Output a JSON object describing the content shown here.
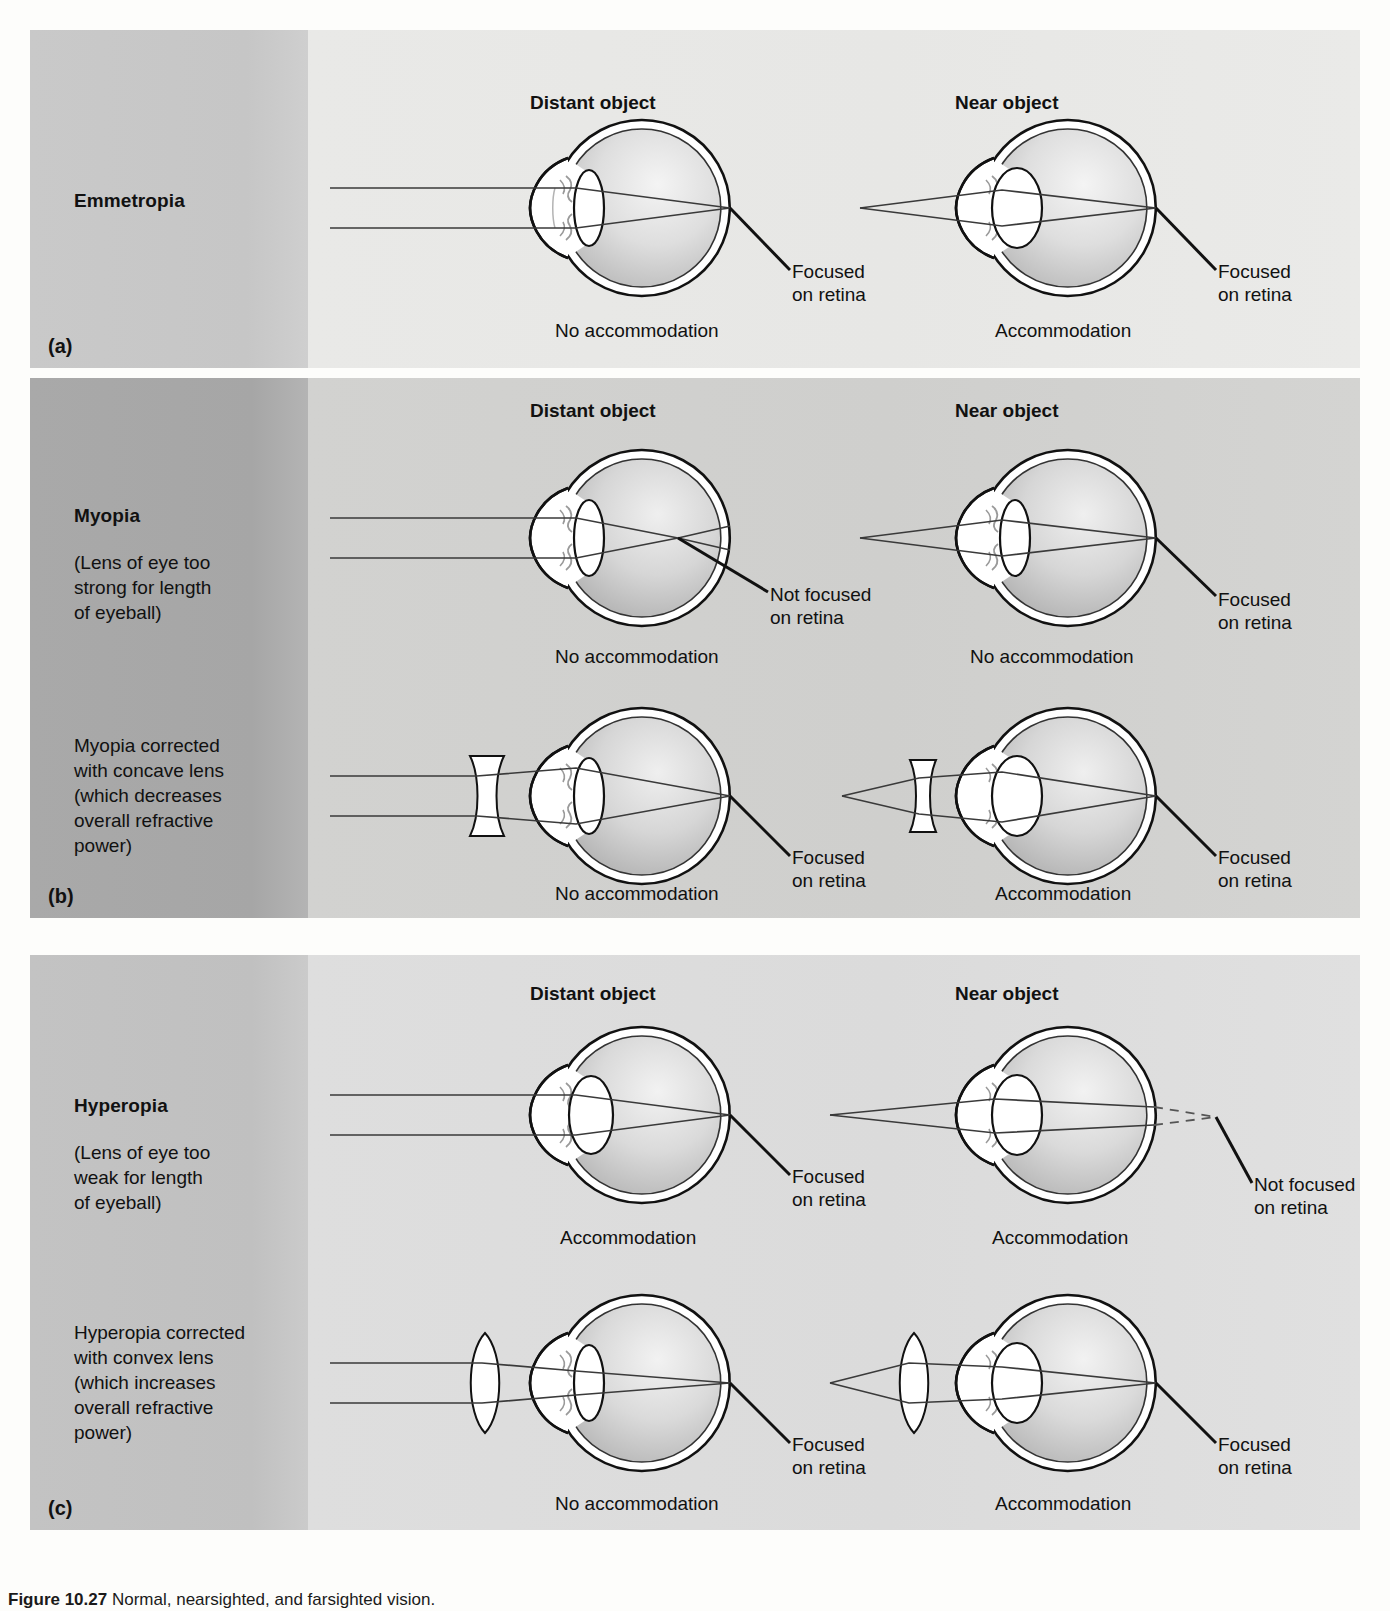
{
  "figure": {
    "caption_label": "Figure 10.27",
    "caption_text": "Normal, nearsighted, and farsighted vision."
  },
  "column_headers": {
    "distant": "Distant object",
    "near": "Near object"
  },
  "labels": {
    "focused": "Focused\non retina",
    "focused_line1": "Focused",
    "focused_line2": "on retina",
    "not_focused_line1": "Not focused",
    "not_focused_line2": "on retina",
    "accommodation": "Accommodation",
    "no_accommodation": "No accommodation"
  },
  "panels": [
    {
      "letter": "(a)",
      "title": "Emmetropia",
      "description": "",
      "rows": [
        {
          "correction": "none",
          "distant": {
            "state": "No accommodation",
            "focus_label_line1": "Focused",
            "focus_label_line2": "on retina",
            "focus_on_retina": true,
            "lens_type": "relaxed",
            "external_lens": "none",
            "ray_source": "parallel"
          },
          "near": {
            "state": "Accommodation",
            "focus_label_line1": "Focused",
            "focus_label_line2": "on retina",
            "focus_on_retina": true,
            "lens_type": "accommodated",
            "external_lens": "none",
            "ray_source": "point"
          }
        }
      ]
    },
    {
      "letter": "(b)",
      "title": "Myopia",
      "description": "(Lens of eye too strong for length of eyeball)",
      "description_lines": [
        "(Lens of eye too",
        "strong for length",
        "of eyeball)"
      ],
      "correction_description_lines": [
        "Myopia corrected",
        "with concave lens",
        "(which decreases",
        "overall refractive",
        "power)"
      ],
      "rows": [
        {
          "correction": "none",
          "distant": {
            "state": "No accommodation",
            "focus_label_line1": "Not focused",
            "focus_label_line2": "on retina",
            "focus_on_retina": false,
            "lens_type": "relaxed",
            "external_lens": "none",
            "ray_source": "parallel"
          },
          "near": {
            "state": "No accommodation",
            "focus_label_line1": "Focused",
            "focus_label_line2": "on retina",
            "focus_on_retina": true,
            "lens_type": "relaxed",
            "external_lens": "none",
            "ray_source": "point"
          }
        },
        {
          "correction": "concave",
          "distant": {
            "state": "No accommodation",
            "focus_label_line1": "Focused",
            "focus_label_line2": "on retina",
            "focus_on_retina": true,
            "lens_type": "relaxed",
            "external_lens": "concave",
            "ray_source": "parallel"
          },
          "near": {
            "state": "Accommodation",
            "focus_label_line1": "Focused",
            "focus_label_line2": "on retina",
            "focus_on_retina": true,
            "lens_type": "accommodated",
            "external_lens": "concave",
            "ray_source": "point"
          }
        }
      ]
    },
    {
      "letter": "(c)",
      "title": "Hyperopia",
      "description": "(Lens of eye too weak for length of eyeball)",
      "description_lines": [
        "(Lens of eye too",
        "weak for length",
        "of eyeball)"
      ],
      "correction_description_lines": [
        "Hyperopia corrected",
        "with convex lens",
        "(which increases",
        "overall refractive",
        "power)"
      ],
      "rows": [
        {
          "correction": "none",
          "distant": {
            "state": "Accommodation",
            "focus_label_line1": "Focused",
            "focus_label_line2": "on retina",
            "focus_on_retina": true,
            "lens_type": "accommodated",
            "external_lens": "none",
            "ray_source": "parallel"
          },
          "near": {
            "state": "Accommodation",
            "focus_label_line1": "Not focused",
            "focus_label_line2": "on retina",
            "focus_on_retina": false,
            "lens_type": "accommodated",
            "external_lens": "none",
            "ray_source": "point"
          }
        },
        {
          "correction": "convex",
          "distant": {
            "state": "No accommodation",
            "focus_label_line1": "Focused",
            "focus_label_line2": "on retina",
            "focus_on_retina": true,
            "lens_type": "relaxed",
            "external_lens": "convex",
            "ray_source": "parallel"
          },
          "near": {
            "state": "Accommodation",
            "focus_label_line1": "Focused",
            "focus_label_line2": "on retina",
            "focus_on_retina": true,
            "lens_type": "accommodated",
            "external_lens": "convex",
            "ray_source": "point"
          }
        }
      ]
    }
  ],
  "colors": {
    "panel_a_sidebar": "#c7c7c7",
    "panel_a_body": "#e8e8e6",
    "panel_b_sidebar": "#a8a8a8",
    "panel_b_body": "#d1d1cf",
    "panel_c_sidebar": "#c1c1c1",
    "panel_c_body": "#dddddb",
    "ray": "#3a3a3a",
    "outline": "#111111",
    "sclera": "#ffffff",
    "vitreous": "#cfcfcf"
  }
}
